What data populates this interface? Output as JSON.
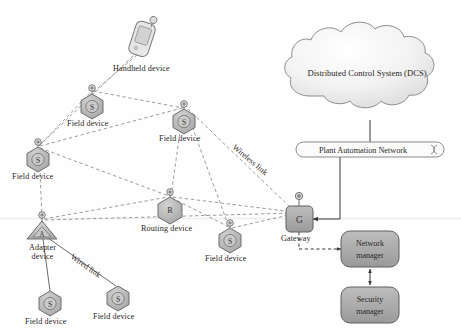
{
  "figure": {
    "background": "#fefefe"
  },
  "palette": {
    "node_fill": "#b3b3b3",
    "node_stroke": "#6e6e6e",
    "box_fill": "#a8a8a8",
    "box_stroke": "#5f5f5f",
    "cloud_fill": "#f2f2f2",
    "cloud_stroke": "#8c8c8c",
    "link_wireless": "#8a8a8a",
    "link_wired": "#6b6b6b",
    "text": "#2b2726"
  },
  "nodes": {
    "handheld": {
      "label": "Handheld device",
      "glyph": "handheld-phone",
      "x": 143,
      "y": 36
    },
    "field_top": {
      "label": "Field device",
      "glyph": "S",
      "x": 92,
      "y": 103
    },
    "field_mid": {
      "label": "Field device",
      "glyph": "S",
      "x": 184,
      "y": 118
    },
    "field_left": {
      "label": "Field device",
      "glyph": "S",
      "x": 37,
      "y": 157
    },
    "routing": {
      "label": "Routing device",
      "glyph": "R",
      "x": 170,
      "y": 205
    },
    "field_right": {
      "label": "Field device",
      "glyph": "S",
      "x": 230,
      "y": 237
    },
    "adapter": {
      "label": "Adapter device",
      "glyph": "A",
      "x": 42,
      "y": 230
    },
    "field_bottom_left": {
      "label": "Field device",
      "glyph": "S",
      "x": 50,
      "y": 301
    },
    "field_bottom_mid": {
      "label": "Field device",
      "glyph": "S",
      "x": 118,
      "y": 296
    },
    "gateway": {
      "label": "Gateway",
      "glyph": "G",
      "x": 299,
      "y": 219
    }
  },
  "cloud": {
    "label": "Distributed Control System (DCS)",
    "cx": 367,
    "cy": 72
  },
  "bar": {
    "label": "Plant Automation Network",
    "x": 296,
    "y": 142,
    "width": 148,
    "height": 15
  },
  "managers": [
    {
      "name": "network-manager",
      "label_line1": "Network",
      "label_line2": "manager",
      "x": 370,
      "y": 249
    },
    {
      "name": "security-manager",
      "label_line1": "Security",
      "label_line2": "manager",
      "x": 370,
      "y": 305
    }
  ],
  "link_labels": {
    "wireless": "Wireless link",
    "wired": "Wired link"
  },
  "legend_notes": {
    "wireless_style": "dashed",
    "wired_style": "solid"
  }
}
